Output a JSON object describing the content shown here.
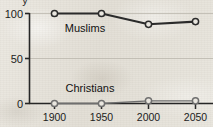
{
  "chart_data": {
    "type": "line",
    "title": "",
    "subtitle": "",
    "xlabel": "",
    "ylabel": "",
    "x": [
      1900,
      1950,
      2000,
      2050
    ],
    "xtick_labels": [
      "1900",
      "1950",
      "2000",
      "2050"
    ],
    "ytick_labels": [
      "0",
      "50",
      "100"
    ],
    "yticks": [
      0,
      50,
      100
    ],
    "ylim": [
      0,
      100
    ],
    "xlim": [
      1900,
      2050
    ],
    "grid": true,
    "grid_axis": "y",
    "legend": "inline-labels",
    "legend_position": "inline",
    "markers": "open-circle",
    "series": [
      {
        "name": "Muslims",
        "label": "Muslims",
        "values": [
          100,
          100,
          88,
          91
        ],
        "color": "#2b2b2b",
        "line_width": 2.1,
        "label_x": 1928,
        "label_y": 78
      },
      {
        "name": "Christians",
        "label": "Christians",
        "values": [
          0,
          0,
          3,
          3
        ],
        "color": "#6f6f6f",
        "line_width": 1.3,
        "label_x": 1931,
        "label_y": 17
      }
    ]
  },
  "axis": {
    "axis_color": "#262626",
    "grid_color": "#b9b5ab",
    "tick_length": 4
  },
  "artifacts": {
    "clipped_top_glyph": "y"
  },
  "colors": {
    "paper_background": "#e9e6df",
    "ink": "#1c1c1c",
    "accent": "#2b2b2b",
    "secondary": "#6f6f6f"
  }
}
